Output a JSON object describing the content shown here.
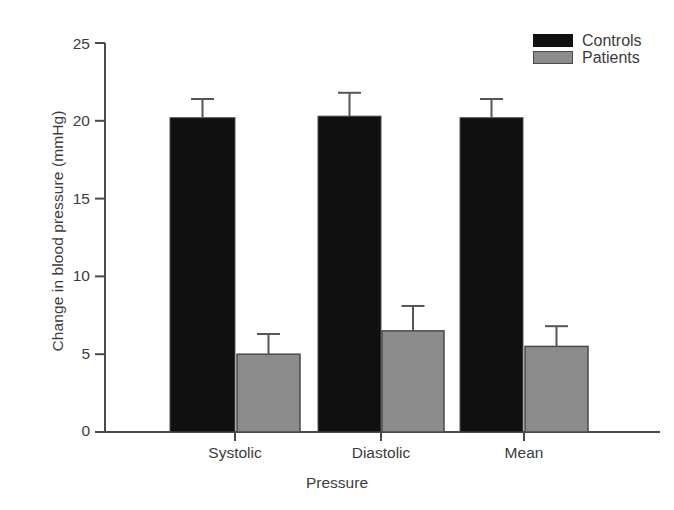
{
  "chart_data": {
    "type": "bar",
    "title": "",
    "subtitle": "",
    "xlabel": "Pressure",
    "ylabel": "Change in blood pressure (mmHg)",
    "categories": [
      "Systolic",
      "Diastolic",
      "Mean"
    ],
    "ylim": [
      0,
      25
    ],
    "yticks": [
      0,
      5,
      10,
      15,
      20,
      25
    ],
    "ytick_labels": [
      "0",
      "5",
      "10",
      "15",
      "20",
      "25"
    ],
    "grid": false,
    "legend_position": "top-right",
    "error_bars": "upper-only",
    "series": [
      {
        "name": "Controls",
        "color": "#101010",
        "values": [
          20.2,
          20.3,
          20.2
        ],
        "errors": [
          1.2,
          1.5,
          1.2
        ]
      },
      {
        "name": "Patients",
        "color": "#8c8c8c",
        "values": [
          5.0,
          6.5,
          5.5
        ],
        "errors": [
          1.3,
          1.6,
          1.3
        ]
      }
    ]
  },
  "legend": {
    "items": [
      {
        "label": "Controls",
        "swatch": "black-swatch-icon"
      },
      {
        "label": "Patients",
        "swatch": "gray-swatch-icon"
      }
    ]
  },
  "caption": {
    "partial_text": ""
  }
}
